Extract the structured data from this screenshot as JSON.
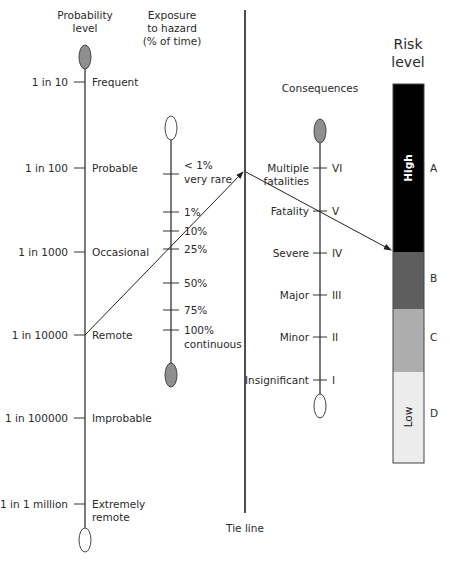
{
  "diagram": {
    "type": "risk nomogram",
    "columns": {
      "probability": {
        "title_lines": [
          "Probability",
          "level"
        ],
        "ticks": [
          {
            "value": "1 in 10",
            "label": [
              "Frequent"
            ]
          },
          {
            "value": "1 in 100",
            "label": [
              "Probable"
            ]
          },
          {
            "value": "1 in 1000",
            "label": [
              "Occasional"
            ]
          },
          {
            "value": "1 in 10000",
            "label": [
              "Remote"
            ]
          },
          {
            "value": "1 in 100000",
            "label": [
              "Improbable"
            ]
          },
          {
            "value": "1 in 1 million",
            "label": [
              "Extremely",
              "remote"
            ]
          }
        ]
      },
      "exposure": {
        "title_lines": [
          "Exposure",
          "to hazard",
          "(% of time)"
        ],
        "ticks": [
          {
            "label": [
              "< 1%",
              "very rare"
            ]
          },
          {
            "label": [
              "1%"
            ]
          },
          {
            "label": [
              "10%"
            ]
          },
          {
            "label": [
              "25%"
            ]
          },
          {
            "label": [
              "50%"
            ]
          },
          {
            "label": [
              "75%"
            ]
          },
          {
            "label": [
              "100%",
              "continuous"
            ]
          }
        ]
      },
      "tie_line": {
        "label": "Tie line"
      },
      "consequences": {
        "title": "Consequences",
        "ticks": [
          {
            "label": [
              "Multiple",
              "fatalities"
            ],
            "grade": "VI"
          },
          {
            "label": [
              "Fatality"
            ],
            "grade": "V"
          },
          {
            "label": [
              "Severe"
            ],
            "grade": "IV"
          },
          {
            "label": [
              "Major"
            ],
            "grade": "III"
          },
          {
            "label": [
              "Minor"
            ],
            "grade": "II"
          },
          {
            "label": [
              "Insignificant"
            ],
            "grade": "I"
          }
        ]
      },
      "risk_level": {
        "title_lines": [
          "Risk",
          "level"
        ],
        "bands": [
          {
            "letter": "A",
            "inner_label": "High",
            "color": "#000000"
          },
          {
            "letter": "B",
            "inner_label": "",
            "color": "#5e5e5e"
          },
          {
            "letter": "C",
            "inner_label": "",
            "color": "#adadad"
          },
          {
            "letter": "D",
            "inner_label": "Low",
            "color": "#ececec"
          }
        ]
      }
    },
    "example_path": [
      {
        "from": "1 in 10000 (Remote)",
        "to": "Tie line"
      },
      {
        "from": "Tie line",
        "to": "Risk level A/B boundary",
        "via": "Fatality (V)"
      }
    ]
  }
}
